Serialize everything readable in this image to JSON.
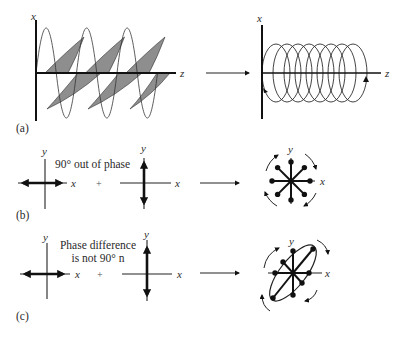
{
  "figure": {
    "colors": {
      "line": "#111111",
      "shade": "#8e8e8e",
      "background": "#ffffff"
    },
    "panel_a": {
      "label": "(a)",
      "left": {
        "vertical_axis": "x",
        "horizontal_axis": "z",
        "description": "linearly polarized components (sine waves) along z"
      },
      "right": {
        "vertical_axis": "x",
        "horizontal_axis": "z",
        "description": "helical circular polarization",
        "rings": 8
      }
    },
    "panel_b": {
      "label": "(b)",
      "annotation": "90° out of phase",
      "plus": "+",
      "component_1": {
        "vertical_axis": "y",
        "horizontal_axis": "x",
        "oscillation": "horizontal"
      },
      "component_2": {
        "vertical_axis": "y",
        "horizontal_axis": "x",
        "oscillation": "vertical"
      },
      "result": {
        "vertical_axis": "y",
        "horizontal_axis": "x",
        "shape": "circle",
        "rotation": "clockwise"
      }
    },
    "panel_c": {
      "label": "(c)",
      "annotation_line1": "Phase difference",
      "annotation_line2": "is not 90° n",
      "plus": "+",
      "component_1": {
        "vertical_axis": "y",
        "horizontal_axis": "x",
        "oscillation": "horizontal"
      },
      "component_2": {
        "vertical_axis": "y",
        "horizontal_axis": "x",
        "oscillation": "vertical"
      },
      "result": {
        "vertical_axis": "y",
        "horizontal_axis": "x",
        "shape": "tilted ellipse",
        "rotation": "clockwise"
      }
    }
  }
}
